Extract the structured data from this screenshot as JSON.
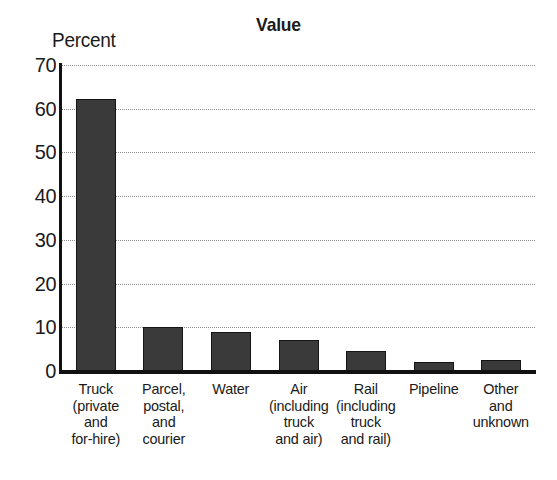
{
  "chart_data": {
    "type": "bar",
    "title": "Value",
    "xlabel": "",
    "ylabel": "Percent",
    "ylim": [
      0,
      70
    ],
    "yticks": [
      0,
      10,
      20,
      30,
      40,
      50,
      60,
      70
    ],
    "ytick_labels": [
      "0",
      "10",
      "20",
      "30",
      "40",
      "50",
      "60",
      "70"
    ],
    "grid": true,
    "legend": false,
    "bar_color": "#3a3a3a",
    "categories": [
      "Truck\n(private\nand\nfor-hire)",
      "Parcel,\npostal,\nand\ncourier",
      "Water",
      "Air\n(including\ntruck\nand air)",
      "Rail\n(including\ntruck\nand rail)",
      "Pipeline",
      "Other\nand\nunknown"
    ],
    "values": [
      62.3,
      10.0,
      9.0,
      7.0,
      4.5,
      2.0,
      2.5
    ]
  }
}
